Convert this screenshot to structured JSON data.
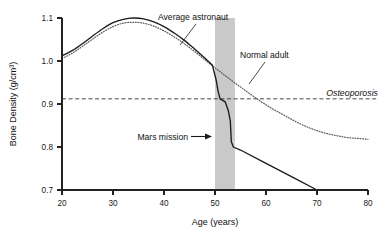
{
  "chart_data": {
    "type": "line",
    "title": "",
    "xlabel": "Age (years)",
    "ylabel": "Bone Density (g/cm³)",
    "xlim": [
      20,
      80
    ],
    "ylim": [
      0.7,
      1.1
    ],
    "xticks": [
      20,
      30,
      40,
      50,
      60,
      70,
      80
    ],
    "yticks": [
      0.7,
      0.8,
      0.9,
      1.0,
      1.1
    ],
    "xtick_labels": [
      "20",
      "30",
      "40",
      "50",
      "60",
      "70",
      "80"
    ],
    "ytick_labels": [
      "0.7",
      "0.8",
      "0.9",
      "1.0",
      "1.1"
    ],
    "grid": false,
    "legend": "none",
    "series": [
      {
        "name": "Average astronaut",
        "style": "solid",
        "color": "#1b1b1b",
        "points": [
          [
            20,
            1.012
          ],
          [
            22,
            1.024
          ],
          [
            24,
            1.04
          ],
          [
            26,
            1.058
          ],
          [
            28,
            1.075
          ],
          [
            30,
            1.089
          ],
          [
            32,
            1.097
          ],
          [
            34,
            1.1
          ],
          [
            36,
            1.098
          ],
          [
            38,
            1.091
          ],
          [
            40,
            1.08
          ],
          [
            42,
            1.065
          ],
          [
            44,
            1.048
          ],
          [
            46,
            1.028
          ],
          [
            48,
            1.007
          ],
          [
            49.5,
            0.99
          ],
          [
            50.2,
            0.957
          ],
          [
            50.6,
            0.93
          ],
          [
            51.0,
            0.912
          ],
          [
            52.0,
            0.905
          ],
          [
            52.6,
            0.885
          ],
          [
            53.0,
            0.861
          ],
          [
            53.2,
            0.812
          ],
          [
            53.6,
            0.8
          ],
          [
            55,
            0.793
          ],
          [
            60,
            0.762
          ],
          [
            65,
            0.731
          ],
          [
            70,
            0.7
          ]
        ]
      },
      {
        "name": "Normal adult",
        "style": "dotted",
        "color": "#5a5a5a",
        "points": [
          [
            20,
            1.006
          ],
          [
            22,
            1.018
          ],
          [
            24,
            1.034
          ],
          [
            26,
            1.051
          ],
          [
            28,
            1.067
          ],
          [
            30,
            1.08
          ],
          [
            32,
            1.088
          ],
          [
            34,
            1.09
          ],
          [
            36,
            1.088
          ],
          [
            38,
            1.081
          ],
          [
            40,
            1.07
          ],
          [
            42,
            1.056
          ],
          [
            44,
            1.04
          ],
          [
            46,
            1.022
          ],
          [
            48,
            1.003
          ],
          [
            50,
            0.984
          ],
          [
            52,
            0.966
          ],
          [
            54,
            0.948
          ],
          [
            56,
            0.931
          ],
          [
            58,
            0.914
          ],
          [
            60,
            0.898
          ],
          [
            62,
            0.884
          ],
          [
            64,
            0.871
          ],
          [
            66,
            0.858
          ],
          [
            68,
            0.847
          ],
          [
            70,
            0.838
          ],
          [
            72,
            0.831
          ],
          [
            74,
            0.826
          ],
          [
            76,
            0.822
          ],
          [
            78,
            0.82
          ],
          [
            80,
            0.818
          ]
        ]
      }
    ],
    "threshold": {
      "label": "Osteoporosis",
      "value": 0.912,
      "style": "dashed"
    },
    "band": {
      "label": "Mars mission",
      "x_start": 50,
      "x_end": 53.9,
      "color": "#c9c9c9"
    },
    "annotations": [
      {
        "label": "Average astronaut",
        "target_x": 43.5,
        "target_y": 1.056
      },
      {
        "label": "Normal adult",
        "target_x": 54.8,
        "target_y": 0.944
      },
      {
        "label": "Osteoporosis",
        "target_x": 74,
        "target_y": 0.912
      },
      {
        "label": "Mars mission",
        "target_x": 51.5,
        "target_y": 0.845
      }
    ]
  },
  "axes": {
    "y_title": "Bone Density (g/cm³)",
    "x_title": "Age (years)",
    "x_tick_0": "20",
    "x_tick_1": "30",
    "x_tick_2": "40",
    "x_tick_3": "50",
    "x_tick_4": "60",
    "x_tick_5": "70",
    "x_tick_6": "80",
    "y_tick_0": "1.1",
    "y_tick_1": "1.0",
    "y_tick_2": "0.9",
    "y_tick_3": "0.8",
    "y_tick_4": "0.7"
  },
  "labels": {
    "average_astronaut": "Average astronaut",
    "normal_adult": "Normal adult",
    "osteoporosis": "Osteoporosis",
    "mars_mission": "Mars mission"
  }
}
